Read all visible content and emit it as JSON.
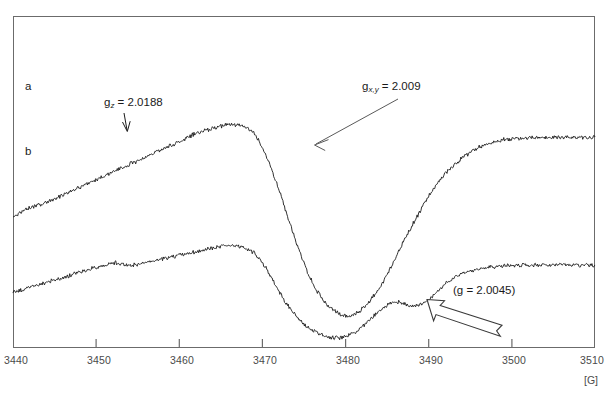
{
  "figure": {
    "kind": "epr-spectrum",
    "background_color": "#ffffff",
    "frame_color": "#6b6b6b",
    "trace_color": "#1a1a1a"
  },
  "axis": {
    "unit_label": "[G]",
    "tick_labels": [
      "3440",
      "3450",
      "3460",
      "3470",
      "3480",
      "3490",
      "3500",
      "3510"
    ],
    "min": 3440,
    "max": 3510,
    "step": 10
  },
  "traces": [
    {
      "id": "a",
      "label": "a"
    },
    {
      "id": "b",
      "label": "b"
    }
  ],
  "annotations": {
    "g_z": {
      "prefix": "g",
      "subscript": "z",
      "equals": " = 2.0188",
      "full_text": "gz = 2.0188"
    },
    "g_xy": {
      "prefix": "g",
      "subscript": "x,y",
      "equals": " = 2.009",
      "full_text": "gx,y = 2.009"
    },
    "g_free": {
      "full_text": "(g = 2.0045)"
    }
  },
  "chart_data": {
    "type": "line",
    "title": "",
    "xlabel": "[G]",
    "ylabel": "",
    "xlim": [
      3440,
      3510
    ],
    "grid": false,
    "legend": "inline-trace-labels",
    "xticks": [
      3440,
      3450,
      3460,
      3470,
      3480,
      3490,
      3500,
      3510
    ],
    "annotations": [
      {
        "text": "gz = 2.0188",
        "x": 3452.5,
        "pointer": "down-arrow",
        "target_trace": "b"
      },
      {
        "text": "gx,y = 2.009",
        "x": 3483.0,
        "pointer": "thin-arrow-down-left",
        "target_trace": "a"
      },
      {
        "text": "(g = 2.0045)",
        "x": 3496.0,
        "pointer": "block-arrow-up-left",
        "target_trace": "b"
      }
    ],
    "series": [
      {
        "name": "a",
        "comment": "EPR first-derivative trace a (upper). y in arbitrary units; x in Gauss.",
        "x": [
          3440,
          3442,
          3444,
          3446,
          3448,
          3450,
          3452,
          3454,
          3456,
          3458,
          3460,
          3462,
          3464,
          3466,
          3467,
          3468,
          3469,
          3470,
          3471,
          3472,
          3473,
          3474,
          3475,
          3476,
          3477,
          3478,
          3479,
          3480,
          3481,
          3482,
          3483,
          3484,
          3485,
          3486,
          3487,
          3488,
          3489,
          3490,
          3491,
          3492,
          3494,
          3496,
          3498,
          3500,
          3504,
          3508,
          3510
        ],
        "y": [
          0.4,
          0.43,
          0.45,
          0.48,
          0.51,
          0.54,
          0.57,
          0.6,
          0.63,
          0.66,
          0.69,
          0.72,
          0.74,
          0.755,
          0.755,
          0.745,
          0.72,
          0.665,
          0.59,
          0.5,
          0.4,
          0.3,
          0.215,
          0.14,
          0.085,
          0.045,
          0.02,
          0.01,
          0.015,
          0.035,
          0.07,
          0.115,
          0.17,
          0.235,
          0.3,
          0.36,
          0.42,
          0.475,
          0.525,
          0.565,
          0.625,
          0.665,
          0.69,
          0.7,
          0.705,
          0.705,
          0.705
        ]
      },
      {
        "name": "b",
        "comment": "EPR first-derivative trace b (lower, offset). Shows g_z shoulder near 3452 and a 2.0045 feature near 3488.",
        "x": [
          3440,
          3442,
          3444,
          3446,
          3448,
          3450,
          3451,
          3452,
          3453,
          3454,
          3456,
          3458,
          3460,
          3462,
          3464,
          3466,
          3467,
          3468,
          3469,
          3470,
          3471,
          3472,
          3473,
          3474,
          3475,
          3476,
          3477,
          3478,
          3479,
          3480,
          3481,
          3482,
          3483,
          3484,
          3485,
          3486,
          3487,
          3488,
          3489,
          3490,
          3491,
          3492,
          3494,
          3496,
          3498,
          3500,
          3504,
          3508,
          3510
        ],
        "y": [
          0.195,
          0.215,
          0.235,
          0.255,
          0.275,
          0.295,
          0.305,
          0.315,
          0.31,
          0.305,
          0.315,
          0.33,
          0.345,
          0.36,
          0.375,
          0.385,
          0.385,
          0.375,
          0.355,
          0.315,
          0.26,
          0.2,
          0.145,
          0.1,
          0.065,
          0.04,
          0.022,
          0.012,
          0.008,
          0.013,
          0.03,
          0.055,
          0.085,
          0.115,
          0.14,
          0.155,
          0.15,
          0.14,
          0.145,
          0.165,
          0.195,
          0.23,
          0.27,
          0.29,
          0.3,
          0.305,
          0.305,
          0.305,
          0.305
        ]
      }
    ]
  }
}
